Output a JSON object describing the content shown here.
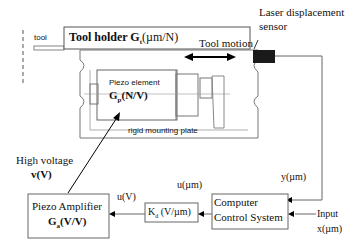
{
  "diagram": {
    "tool_label": "tool",
    "tool_holder": {
      "label": "Tool holder G",
      "sub": "t",
      "unit": "(µm/N)"
    },
    "laser_sensor": {
      "line1": "Laser displacement",
      "line2": "sensor"
    },
    "tool_motion": "Tool motion",
    "piezo_element": {
      "label": "Piezo element",
      "gain": "G",
      "sub": "p",
      "unit": "(N/V)"
    },
    "mounting_plate": "rigid mounting plate",
    "high_voltage": {
      "line1": "High voltage",
      "line2": "v(V)"
    },
    "piezo_amplifier": {
      "line1": "Piezo Amplifier",
      "gain": "G",
      "sub": "a",
      "unit": "(V/V)"
    },
    "u_v": "u(V)",
    "u_um": "u(µm)",
    "kd_block": {
      "gain": "K",
      "sub": "d",
      "unit": " (V/µm)"
    },
    "computer": {
      "line1": "Computer",
      "line2": "Control System"
    },
    "y_label": "y(µm)",
    "input": {
      "line1": "Input",
      "line2": "x(µm)"
    },
    "colors": {
      "line": "#444444",
      "sensor": "#1a1a1a",
      "box": "#666666"
    }
  }
}
